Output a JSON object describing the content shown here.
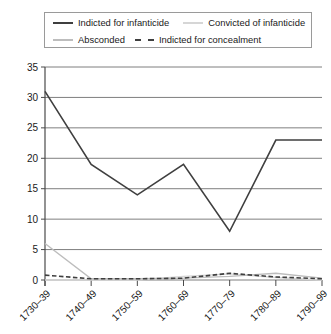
{
  "legend": {
    "entries": [
      {
        "label": "Indicted for infanticide",
        "style": "solid-dark",
        "color": "#3f3f3f"
      },
      {
        "label": "Convicted of infanticide",
        "style": "solid-pale",
        "color": "#d6d6d6"
      },
      {
        "label": "Absconded",
        "style": "solid-light",
        "color": "#bdbdbd"
      },
      {
        "label": "Indicted for concealment",
        "style": "dashed-dark",
        "color": "#3f3f3f"
      }
    ]
  },
  "axes": {
    "y_ticks": [
      "0",
      "5",
      "10",
      "15",
      "20",
      "25",
      "30",
      "35"
    ],
    "x_ticks": [
      "1730–39",
      "1740–49",
      "1750–59",
      "1760–69",
      "1770–79",
      "1780–89",
      "1790–99"
    ]
  },
  "chart_data": {
    "type": "line",
    "title": "",
    "xlabel": "",
    "ylabel": "",
    "ylim": [
      0,
      35
    ],
    "ytick_step": 5,
    "grid": "horizontal",
    "legend_position": "top",
    "categories": [
      "1730–39",
      "1740–49",
      "1750–59",
      "1760–69",
      "1770–79",
      "1780–89",
      "1790–99"
    ],
    "series": [
      {
        "name": "Indicted for infanticide",
        "color": "#3f3f3f",
        "linestyle": "solid",
        "width": 1.6,
        "values": [
          31,
          19,
          14,
          19,
          8,
          23,
          23
        ]
      },
      {
        "name": "Convicted of infanticide",
        "color": "#d6d6d6",
        "linestyle": "solid",
        "width": 1.4,
        "values": [
          0,
          0,
          0,
          0.6,
          1,
          0.4,
          0
        ]
      },
      {
        "name": "Absconded",
        "color": "#bdbdbd",
        "linestyle": "solid",
        "width": 1.4,
        "values": [
          6,
          0.2,
          0.2,
          0.3,
          0.6,
          1.1,
          0.3
        ]
      },
      {
        "name": "Indicted for concealment",
        "color": "#3f3f3f",
        "linestyle": "dashed",
        "width": 1.6,
        "values": [
          0.8,
          0.2,
          0.2,
          0.3,
          1.1,
          0.5,
          0.2
        ]
      }
    ]
  }
}
